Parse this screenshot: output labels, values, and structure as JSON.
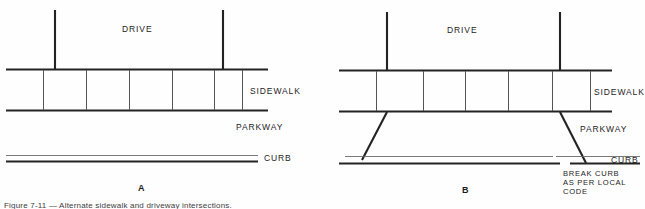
{
  "figure": {
    "panels": [
      {
        "id": "A",
        "caption": "A",
        "labels": {
          "drive": "DRIVE",
          "sidewalk": "SIDEWALK",
          "parkway": "PARKWAY",
          "curb": "CURB"
        }
      },
      {
        "id": "B",
        "caption": "B",
        "labels": {
          "drive": "DRIVE",
          "sidewalk": "SIDEWALK",
          "parkway": "PARKWAY",
          "curb": "CURB"
        },
        "note": {
          "line1": "BREAK CURB",
          "line2": "AS PER LOCAL",
          "line3": "CODE"
        }
      }
    ],
    "bottom_caption": "Figure 7-11 — Alternate sidewalk and driveway intersections.",
    "colors": {
      "ink": "#232323",
      "paper": "#fefefe",
      "light_line": "#6a6a6a"
    }
  }
}
